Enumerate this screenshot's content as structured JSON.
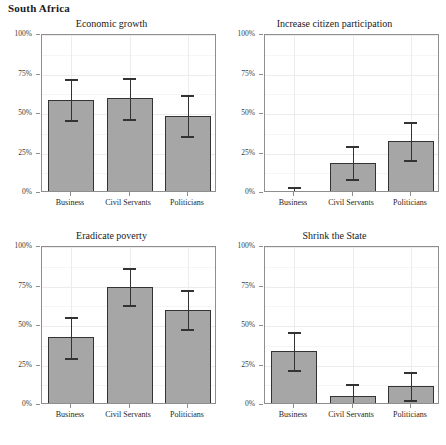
{
  "figure": {
    "title": "South Africa",
    "bar_fill": "#a6a6a6",
    "bar_stroke": "#333333",
    "grid_color": "#ececec"
  },
  "chart_data": {
    "type": "bar",
    "title": "South Africa",
    "xlabel": "",
    "ylabel": "",
    "ylim": [
      0,
      100
    ],
    "ytick_labels": [
      "0%",
      "25%",
      "50%",
      "75%",
      "100%"
    ],
    "ytick_values": [
      0,
      25,
      50,
      75,
      100
    ],
    "categories": [
      "Business",
      "Civil Servants",
      "Politicians"
    ],
    "grid": true,
    "legend": "none",
    "error_bars": "confidence interval",
    "units": "percent",
    "panels": [
      {
        "title": "Economic growth",
        "values": [
          59,
          60,
          49
        ],
        "err_low": [
          46,
          47,
          36
        ],
        "err_high": [
          72,
          73,
          62
        ]
      },
      {
        "title": "Increase citizen participation",
        "values": [
          1,
          19,
          33
        ],
        "err_low": [
          0,
          9,
          21
        ],
        "err_high": [
          4,
          30,
          45
        ]
      },
      {
        "title": "Eradicate poverty",
        "values": [
          43,
          75,
          60
        ],
        "err_low": [
          30,
          63,
          48
        ],
        "err_high": [
          56,
          87,
          73
        ]
      },
      {
        "title": "Shrink the State",
        "values": [
          34,
          6,
          12
        ],
        "err_low": [
          22,
          0,
          3
        ],
        "err_high": [
          46,
          13,
          21
        ]
      }
    ]
  }
}
